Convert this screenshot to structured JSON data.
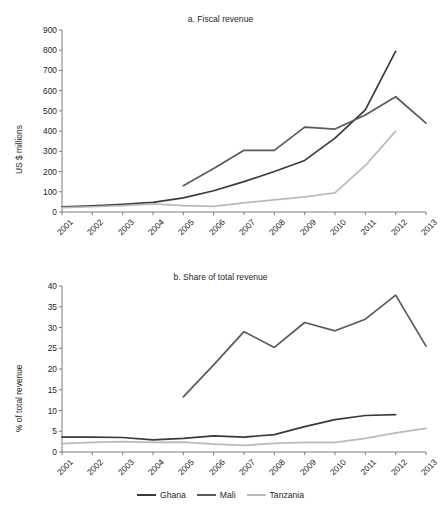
{
  "top_cropped_text": "",
  "colors": {
    "ghana": "#3a3a3c",
    "mali": "#58595b",
    "tanzania": "#b8b9bb",
    "axis": "#6d6e71",
    "text": "#231f20"
  },
  "legend": {
    "items": [
      {
        "label": "Ghana",
        "color": "#3a3a3c"
      },
      {
        "label": "Mali",
        "color": "#58595b"
      },
      {
        "label": "Tanzania",
        "color": "#b8b9bb"
      }
    ]
  },
  "chart_data": [
    {
      "id": "a",
      "type": "line",
      "title": "a. Fiscal revenue",
      "xlabel": "",
      "ylabel": "US $ millions",
      "categories": [
        "2001",
        "2002",
        "2003",
        "2004",
        "2005",
        "2006",
        "2007",
        "2008",
        "2009",
        "2010",
        "2011",
        "2012",
        "2013"
      ],
      "x": [
        2001,
        2002,
        2003,
        2004,
        2005,
        2006,
        2007,
        2008,
        2009,
        2010,
        2011,
        2012,
        2013
      ],
      "ylim": [
        0,
        900
      ],
      "yticks": [
        0,
        100,
        200,
        300,
        400,
        500,
        600,
        700,
        800,
        900
      ],
      "grid": false,
      "legend_position": "bottom",
      "series": [
        {
          "name": "Ghana",
          "color": "#3a3a3c",
          "values": [
            25,
            30,
            38,
            48,
            70,
            105,
            150,
            200,
            255,
            365,
            505,
            795,
            null
          ]
        },
        {
          "name": "Mali",
          "color": "#58595b",
          "values": [
            null,
            null,
            null,
            null,
            130,
            215,
            305,
            305,
            420,
            410,
            480,
            570,
            440
          ]
        },
        {
          "name": "Tanzania",
          "color": "#b8b9bb",
          "values": [
            22,
            26,
            32,
            40,
            32,
            28,
            45,
            60,
            75,
            95,
            230,
            400,
            null
          ]
        }
      ]
    },
    {
      "id": "b",
      "type": "line",
      "title": "b. Share of total revenue",
      "xlabel": "",
      "ylabel": "% of total revenue",
      "categories": [
        "2001",
        "2002",
        "2003",
        "2004",
        "2005",
        "2006",
        "2007",
        "2008",
        "2009",
        "2010",
        "2011",
        "2012",
        "2013"
      ],
      "x": [
        2001,
        2002,
        2003,
        2004,
        2005,
        2006,
        2007,
        2008,
        2009,
        2010,
        2011,
        2012,
        2013
      ],
      "ylim": [
        0,
        40
      ],
      "yticks": [
        0,
        5,
        10,
        15,
        20,
        25,
        30,
        35,
        40
      ],
      "grid": false,
      "legend_position": "bottom",
      "series": [
        {
          "name": "Ghana",
          "color": "#3a3a3c",
          "values": [
            3.6,
            3.6,
            3.5,
            2.9,
            3.3,
            3.9,
            3.6,
            4.2,
            6.1,
            7.8,
            8.8,
            9.0,
            null
          ]
        },
        {
          "name": "Mali",
          "color": "#58595b",
          "values": [
            null,
            null,
            null,
            null,
            13.3,
            21.0,
            29.0,
            25.2,
            31.2,
            29.2,
            32.0,
            37.8,
            25.5
          ]
        },
        {
          "name": "Tanzania",
          "color": "#b8b9bb",
          "values": [
            2.0,
            2.3,
            2.5,
            2.3,
            2.4,
            1.9,
            1.6,
            2.1,
            2.3,
            2.3,
            3.3,
            4.6,
            5.7
          ]
        }
      ]
    }
  ]
}
